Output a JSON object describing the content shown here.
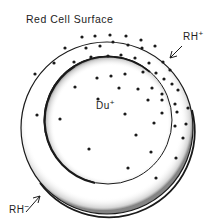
{
  "title": "Red Cell Surface",
  "labels": {
    "rh_plus": {
      "base": "RH",
      "sup": "+"
    },
    "rh_minus": {
      "base": "RH",
      "sup": "−"
    },
    "du_plus": {
      "base": "Du",
      "sup": "+"
    }
  },
  "colors": {
    "ink": "#1a1a1a",
    "background": "#ffffff"
  },
  "geometry": {
    "outer_circle": {
      "cx": 107,
      "cy": 128,
      "r": 86
    },
    "inner_circle": {
      "cx": 108,
      "cy": 120,
      "r": 64
    }
  },
  "dots": [
    [
      82,
      37
    ],
    [
      95,
      36
    ],
    [
      110,
      35
    ],
    [
      126,
      36
    ],
    [
      141,
      40
    ],
    [
      65,
      48
    ],
    [
      86,
      48
    ],
    [
      100,
      46
    ],
    [
      113,
      42
    ],
    [
      128,
      45
    ],
    [
      142,
      48
    ],
    [
      155,
      46
    ],
    [
      54,
      63
    ],
    [
      74,
      62
    ],
    [
      91,
      57
    ],
    [
      108,
      56
    ],
    [
      121,
      55
    ],
    [
      135,
      58
    ],
    [
      149,
      63
    ],
    [
      163,
      62
    ],
    [
      170,
      70
    ],
    [
      35,
      74
    ],
    [
      97,
      78
    ],
    [
      111,
      76
    ],
    [
      125,
      74
    ],
    [
      143,
      72
    ],
    [
      156,
      73
    ],
    [
      164,
      79
    ],
    [
      172,
      84
    ],
    [
      75,
      87
    ],
    [
      119,
      88
    ],
    [
      138,
      89
    ],
    [
      152,
      88
    ],
    [
      162,
      94
    ],
    [
      178,
      90
    ],
    [
      98,
      99
    ],
    [
      148,
      100
    ],
    [
      162,
      100
    ],
    [
      175,
      104
    ],
    [
      37,
      115
    ],
    [
      60,
      119
    ],
    [
      125,
      114
    ],
    [
      162,
      113
    ],
    [
      177,
      112
    ],
    [
      188,
      108
    ],
    [
      154,
      123
    ],
    [
      175,
      126
    ],
    [
      186,
      124
    ],
    [
      136,
      135
    ],
    [
      183,
      138
    ],
    [
      89,
      149
    ],
    [
      151,
      152
    ],
    [
      176,
      158
    ],
    [
      128,
      168
    ],
    [
      156,
      178
    ]
  ]
}
